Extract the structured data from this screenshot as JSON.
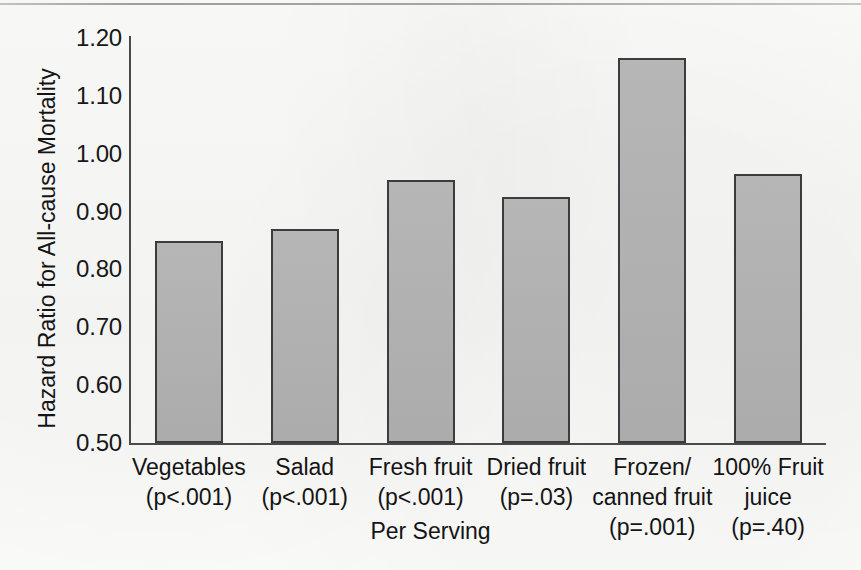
{
  "figure": {
    "background_color": "#fbfbfa",
    "bar_fill_color": "#b2b2b2",
    "bar_edge_color": "#3c3c3c",
    "axis_color": "#4a4a4a"
  },
  "chart_data": {
    "type": "bar",
    "title": "",
    "xlabel": "Per Serving",
    "ylabel": "Hazard Ratio for All-cause Mortality",
    "categories": [
      "Vegetables",
      "Salad",
      "Fresh fruit",
      "Dried fruit",
      "Frozen/ canned fruit",
      "100% Fruit juice"
    ],
    "category_lines": [
      [
        "Vegetables",
        "(p<.001)"
      ],
      [
        "Salad",
        "(p<.001)"
      ],
      [
        "Fresh fruit",
        "(p<.001)"
      ],
      [
        "Dried fruit",
        "(p=.03)"
      ],
      [
        "Frozen/",
        "canned fruit",
        "(p=.001)"
      ],
      [
        "100% Fruit",
        "juice",
        "(p=.40)"
      ]
    ],
    "p_values": [
      "(p<.001)",
      "(p<.001)",
      "(p<.001)",
      "(p=.03)",
      "(p=.001)",
      "(p=.40)"
    ],
    "values": [
      0.85,
      0.87,
      0.955,
      0.925,
      1.165,
      0.965
    ],
    "ylim": [
      0.5,
      1.2
    ],
    "yticks": [
      0.5,
      0.6,
      0.7,
      0.8,
      0.9,
      1.0,
      1.1,
      1.2
    ],
    "ytick_labels": [
      "0.50",
      "0.60",
      "0.70",
      "0.80",
      "0.90",
      "1.00",
      "1.10",
      "1.20"
    ],
    "grid": false,
    "legend": "none"
  }
}
